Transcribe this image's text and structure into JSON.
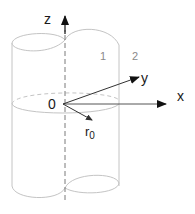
{
  "diagram": {
    "type": "3D coordinate system with two-lobed cylinder",
    "axes": {
      "z": {
        "label": "z"
      },
      "y": {
        "label": "y"
      },
      "x": {
        "label": "x"
      }
    },
    "origin": {
      "label": "0"
    },
    "radius_vector": {
      "label": "r",
      "subscript": "0"
    },
    "regions": [
      {
        "label": "1"
      },
      {
        "label": "2"
      }
    ],
    "colors": {
      "outline": "#bdbdbd",
      "axis": "#4a4a4a",
      "arrowhead": "#111111",
      "text": "#1a1a1a",
      "region_text": "#8a8a8a"
    }
  }
}
